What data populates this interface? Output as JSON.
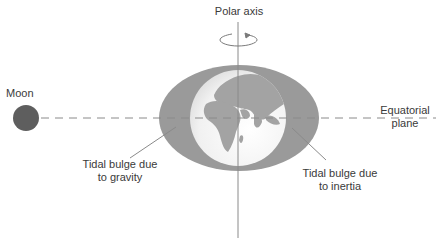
{
  "diagram": {
    "labels": {
      "polar_axis": "Polar axis",
      "moon": "Moon",
      "equatorial_plane": [
        "Equatorial",
        "plane"
      ],
      "tidal_bulge_gravity": [
        "Tidal bulge due",
        "to gravity"
      ],
      "tidal_bulge_inertia": [
        "Tidal bulge due",
        "to inertia"
      ]
    },
    "icons": {
      "rotation": "rotation-arrow-icon",
      "moon": "moon-circle",
      "earth": "globe-icon"
    },
    "colors": {
      "bulge": "#9a9a9a",
      "moon": "#5e5e5e",
      "earth_light": "#f4f4f4",
      "land": "#a0a0a0",
      "lines": "#8a8a8a",
      "text": "#3a3a3a"
    }
  }
}
